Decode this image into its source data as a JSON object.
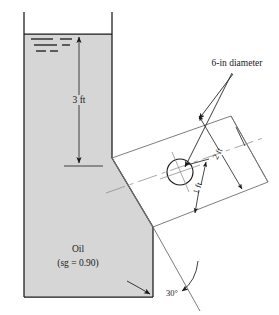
{
  "figure": {
    "colors": {
      "oil_fill": "#d6d6d6",
      "outline": "#1a1a1a",
      "plate_outline": "#6e6e6e",
      "centerline": "#8a8a8a",
      "background": "#ffffff"
    },
    "labels": {
      "depth": "3 ft",
      "fluid_name": "Oil",
      "fluid_property": "(sg = 0.90)",
      "pipe_diameter": "6-in diameter",
      "dim_long": "2 ft",
      "dim_short": "1 ft",
      "angle": "30°"
    },
    "icons": {
      "free_surface": "free-surface-hatch-icon",
      "depth_arrow": "double-headed-arrow-icon",
      "angle_arrow": "curved-angle-arrow-icon",
      "gate": "circular-gate-icon"
    },
    "annotations": {
      "depth_meaning": "vertical distance from oil free surface down to the upper edge of the inclined plate",
      "dim_long_meaning": "slant distance measured along the inclined plate",
      "dim_short_meaning": "slant distance from the gate center down along the inclined plate",
      "angle_meaning": "inclination of the plate measured from the tank bottom"
    }
  }
}
